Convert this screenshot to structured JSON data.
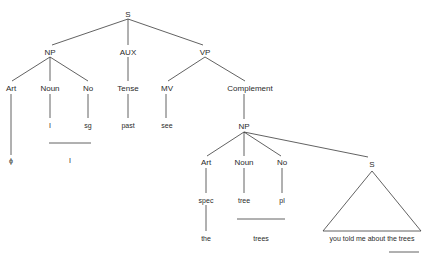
{
  "diagram": {
    "type": "syntax-tree",
    "nodes": {
      "root_s": "S",
      "np": "NP",
      "aux": "AUX",
      "vp": "VP",
      "art": "Art",
      "noun": "Noun",
      "no": "No",
      "tense": "Tense",
      "mv": "MV",
      "complement": "Complement",
      "art_leaf": "ϕ",
      "noun_leaf": "I",
      "no_leaf": "sg",
      "tense_leaf": "past",
      "mv_leaf": "see",
      "np_surface": "I",
      "np2": "NP",
      "art2": "Art",
      "noun2": "Noun",
      "no2": "No",
      "s2": "S",
      "art2_leaf": "spec",
      "noun2_leaf": "tree",
      "no2_leaf": "pl",
      "art2_surface": "the",
      "noun2_surface": "trees",
      "s2_content": "you told me about the trees"
    }
  }
}
